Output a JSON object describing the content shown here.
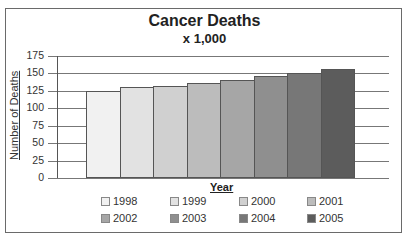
{
  "chart_data": {
    "type": "bar",
    "title": "Cancer Deaths",
    "subtitle": "x 1,000",
    "xlabel": "Year",
    "ylabel": "Number of Deaths",
    "categories": [
      "1998",
      "1999",
      "2000",
      "2001",
      "2002",
      "2003",
      "2004",
      "2005"
    ],
    "values": [
      125,
      130,
      132,
      136,
      141,
      146,
      151,
      156
    ],
    "ylim": [
      0,
      175
    ],
    "yticks": [
      0,
      25,
      50,
      75,
      100,
      125,
      150,
      175
    ],
    "grid": true,
    "legend_position": "bottom",
    "colors": [
      "#f1f1f1",
      "#e2e2e2",
      "#d0d0d0",
      "#bcbcbc",
      "#a6a6a6",
      "#8f8f8f",
      "#777777",
      "#5c5c5c"
    ]
  },
  "labels": {
    "title": "Cancer Deaths",
    "subtitle": "x 1,000",
    "xlabel": "Year",
    "ylabel": "Number of Deaths",
    "yticks": [
      "175",
      "150",
      "125",
      "100",
      "75",
      "50",
      "25",
      "0"
    ],
    "legend": [
      "1998",
      "1999",
      "2000",
      "2001",
      "2002",
      "2003",
      "2004",
      "2005"
    ]
  }
}
